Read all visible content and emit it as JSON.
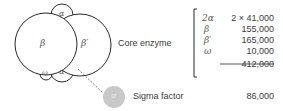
{
  "diagram": {
    "subunits": {
      "beta": "β",
      "beta_prime": "β′",
      "alpha_top": "α",
      "alpha_bottom": "α",
      "omega": "ω",
      "sigma": "σ"
    },
    "core_label": "Core enzyme",
    "sigma_label": "Sigma factor",
    "sigma_mass": "86,000",
    "core_table": {
      "rows": [
        {
          "subunit": "2α",
          "mass": "2 × 41,000"
        },
        {
          "subunit": "β",
          "mass": "155,000"
        },
        {
          "subunit": "β′",
          "mass": "165,000"
        },
        {
          "subunit": "ω",
          "mass": "10,000"
        }
      ],
      "total": "412,000"
    },
    "colors": {
      "outline": "#2a2a2a",
      "sigma_fill": "#c8c8c8",
      "text": "#3a3a3a"
    }
  }
}
